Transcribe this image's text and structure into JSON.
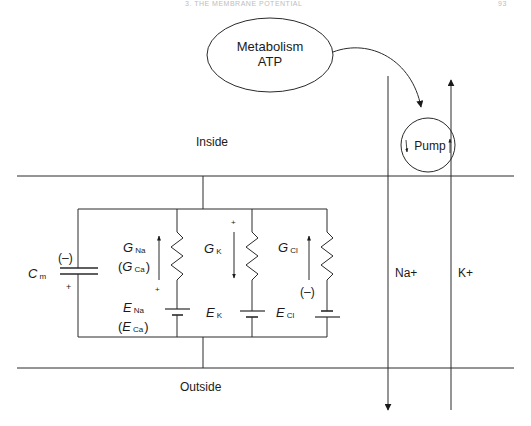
{
  "header": {
    "running_title": "3. THE MEMBRANE POTENTIAL",
    "page_number": "93"
  },
  "metabolism": {
    "line1": "Metabolism",
    "line2": "ATP"
  },
  "regions": {
    "inside": "Inside",
    "outside": "Outside"
  },
  "pump": {
    "label": "Pump"
  },
  "ion_flows": {
    "na": "Na+",
    "k": "K+"
  },
  "capacitor": {
    "symbol": "C",
    "subscript": "m",
    "top_sign": "(–)",
    "bottom_sign": "+"
  },
  "branches": [
    {
      "conductance": {
        "symbol": "G",
        "sub": "Na"
      },
      "conductance_alt": {
        "open": "(",
        "symbol": "G",
        "sub": "Ca",
        "close": ")"
      },
      "battery": {
        "symbol": "E",
        "sub": "Na"
      },
      "battery_alt": {
        "open": "(",
        "symbol": "E",
        "sub": "Ca",
        "close": ")"
      },
      "current_direction": "up",
      "sign": "+"
    },
    {
      "conductance": {
        "symbol": "G",
        "sub": "K"
      },
      "battery": {
        "symbol": "E",
        "sub": "K"
      },
      "current_direction": "down",
      "sign": "+"
    },
    {
      "conductance": {
        "symbol": "G",
        "sub": "Cl"
      },
      "battery": {
        "symbol": "E",
        "sub": "Cl"
      },
      "current_direction": "up",
      "sign": "(–)"
    }
  ],
  "colors": {
    "line": "#2a2a2a",
    "text": "#1a1a1a",
    "background": "#ffffff"
  }
}
